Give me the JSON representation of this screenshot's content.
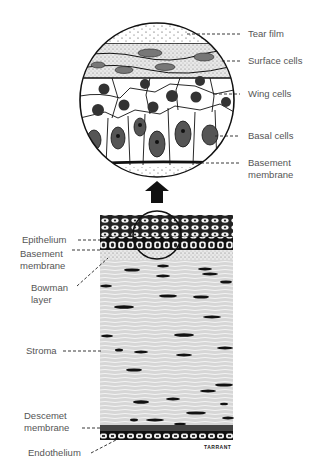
{
  "diagram": {
    "magnified_labels": [
      {
        "id": "tear-film",
        "text": "Tear film"
      },
      {
        "id": "surface-cells",
        "text": "Surface cells"
      },
      {
        "id": "wing-cells",
        "text": "Wing cells"
      },
      {
        "id": "basal-cells",
        "text": "Basal cells"
      },
      {
        "id": "basement-membrane",
        "line1": "Basement",
        "line2": "membrane"
      }
    ],
    "layer_labels": [
      {
        "id": "epithelium",
        "text": "Epithelium"
      },
      {
        "id": "basement-membrane",
        "line1": "Basement",
        "line2": "membrane"
      },
      {
        "id": "bowman-layer",
        "line1": "Bowman",
        "line2": "layer"
      },
      {
        "id": "stroma",
        "text": "Stroma"
      },
      {
        "id": "descemet-membrane",
        "line1": "Descemet",
        "line2": "membrane"
      },
      {
        "id": "endothelium",
        "text": "Endothelium"
      }
    ],
    "signature": "TARRANT",
    "colors": {
      "ink": "#111111",
      "label": "#555555",
      "stroma": "#d9d9d9",
      "background": "#ffffff"
    }
  }
}
